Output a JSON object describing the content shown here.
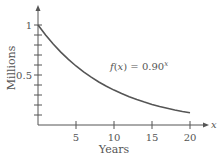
{
  "chart_data": {
    "type": "line",
    "title": "",
    "xlabel": "Years",
    "ylabel": "Millions",
    "x_axis_symbol": "x",
    "xlim": [
      0,
      20
    ],
    "ylim": [
      0,
      1
    ],
    "x_ticks": [
      5,
      10,
      15,
      20
    ],
    "x_tick_labels": [
      "5",
      "10",
      "15",
      "20"
    ],
    "y_ticks": [
      0.1,
      0.2,
      0.3,
      0.4,
      0.5,
      0.6,
      0.7,
      0.8,
      0.9,
      1.0
    ],
    "y_tick_labels": {
      "0.5": "0.5",
      "1": "1"
    },
    "grid": false,
    "legend": null,
    "annotation": {
      "text_prefix": "f(x) = 0.90",
      "superscript": "x"
    },
    "series": [
      {
        "name": "f(x) = 0.90^x",
        "function": "0.90^x",
        "x": [
          0,
          1,
          2,
          3,
          4,
          5,
          6,
          7,
          8,
          9,
          10,
          11,
          12,
          13,
          14,
          15,
          16,
          17,
          18,
          19,
          20
        ],
        "values": [
          1.0,
          0.9,
          0.81,
          0.729,
          0.656,
          0.59,
          0.531,
          0.478,
          0.43,
          0.387,
          0.349,
          0.314,
          0.282,
          0.254,
          0.229,
          0.206,
          0.185,
          0.167,
          0.15,
          0.135,
          0.122
        ]
      }
    ],
    "colors": {
      "axis": "#555555",
      "curve": "#555555"
    }
  }
}
